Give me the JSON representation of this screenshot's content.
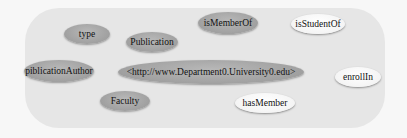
{
  "diagram": {
    "nodes": [
      {
        "id": "type",
        "label": "type",
        "style": "gray"
      },
      {
        "id": "publication",
        "label": "Publication",
        "style": "gray"
      },
      {
        "id": "isMemberOf",
        "label": "isMemberOf",
        "style": "gray"
      },
      {
        "id": "isStudentOf",
        "label": "isStudentOf",
        "style": "white"
      },
      {
        "id": "publicationAuthor",
        "label": "piblicationAuthor",
        "style": "gray"
      },
      {
        "id": "uri",
        "label": "<http://www.Department0.University0.edu>",
        "style": "gray"
      },
      {
        "id": "enrollIn",
        "label": "enrollIn",
        "style": "white"
      },
      {
        "id": "faculty",
        "label": "Faculty",
        "style": "gray"
      },
      {
        "id": "hasMember",
        "label": "hasMember",
        "style": "white"
      }
    ],
    "colors": {
      "gray_node": "#9e9e9e",
      "white_node": "#ffffff",
      "panel": "#e6e6e6",
      "background": "#f7f7f7"
    }
  }
}
